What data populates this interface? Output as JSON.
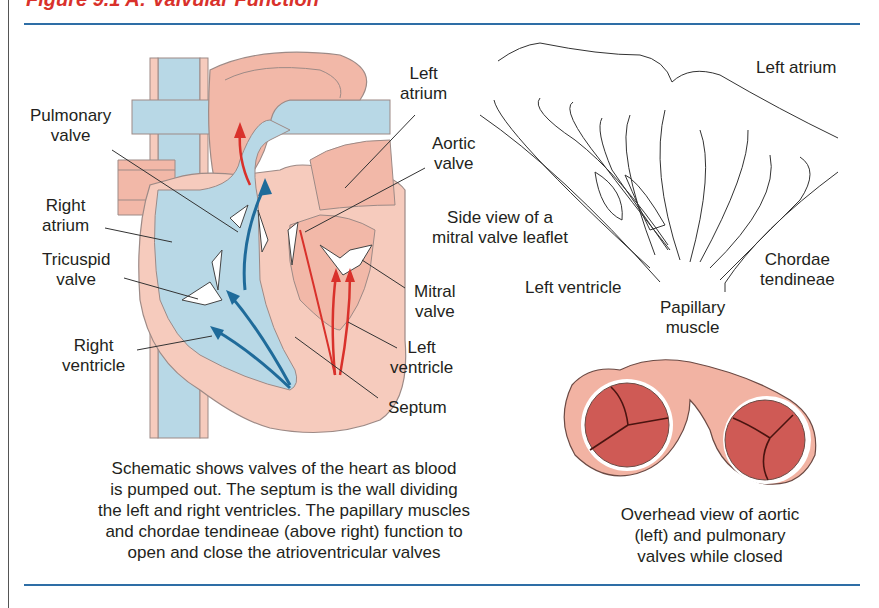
{
  "figure": {
    "title": "Figure 9.1 A: Valvular Function",
    "accent_color": "#d9312b",
    "rule_color": "#2e6ea6"
  },
  "heart_diagram": {
    "labels": {
      "pulmonary_valve": [
        "Pulmonary",
        "valve"
      ],
      "right_atrium": [
        "Right",
        "atrium"
      ],
      "tricuspid_valve": [
        "Tricuspid",
        "valve"
      ],
      "right_ventricle": [
        "Right",
        "ventricle"
      ],
      "left_atrium": [
        "Left",
        "atrium"
      ],
      "aortic_valve": [
        "Aortic",
        "valve"
      ],
      "mitral_valve": [
        "Mitral",
        "valve"
      ],
      "left_ventricle": [
        "Left",
        "ventricle"
      ],
      "septum": "Septum"
    },
    "colors": {
      "deoxygenated": "#b8d8e6",
      "oxygenated": "#f2b8a8",
      "tissue": "#f6cbbd",
      "blue_arrow": "#1f6b9a",
      "red_arrow": "#d9312b"
    },
    "caption": [
      "Schematic shows valves of the heart as blood",
      "is pumped out. The septum is the wall dividing",
      "the left and right ventricles. The papillary muscles",
      "and chordae tendineae (above right) function to",
      "open and close the atrioventricular valves"
    ]
  },
  "mitral_side_view": {
    "labels": {
      "left_atrium": "Left atrium",
      "side_view": [
        "Side view of a",
        "mitral valve leaflet"
      ],
      "left_ventricle": "Left ventricle",
      "papillary_muscle": [
        "Papillary",
        "muscle"
      ],
      "chordae_tendineae": [
        "Chordae",
        "tendineae"
      ]
    }
  },
  "overhead_view": {
    "caption": [
      "Overhead view of aortic",
      "(left) and pulmonary",
      "valves while closed"
    ],
    "colors": {
      "ring": "#f2b3a3",
      "valve": "#cf5a55",
      "line": "#4a1410"
    }
  }
}
